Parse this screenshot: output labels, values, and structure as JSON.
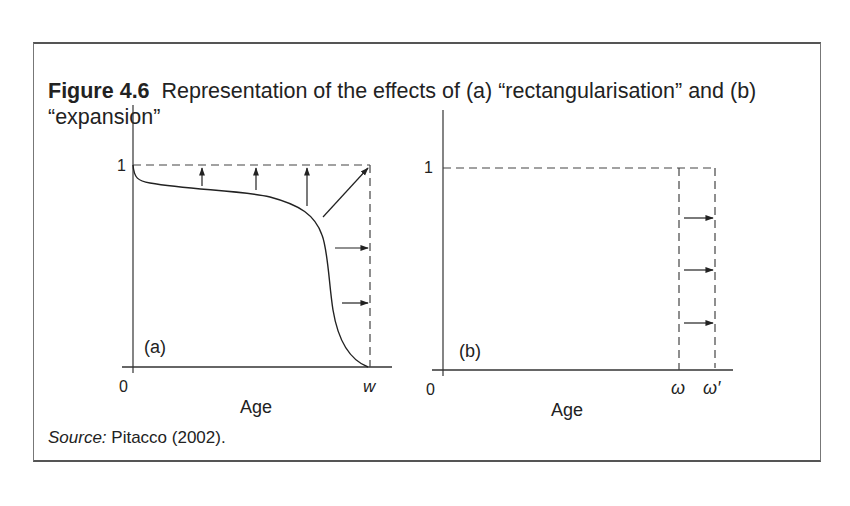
{
  "figure": {
    "label": "Figure 4.6",
    "caption": "Representation of the effects of (a) “rectangularisation” and (b) “expansion”",
    "source_label": "Source:",
    "source_text": "Pitacco (2002)."
  },
  "panels": [
    {
      "id": "a",
      "tag": "(a)",
      "y_tick": "1",
      "x_origin": "0",
      "x_end": "w",
      "x_label": "Age",
      "description": "Survival curve shifting towards the rectangle (rectangularisation), arrows point up and to the right"
    },
    {
      "id": "b",
      "tag": "(b)",
      "y_tick": "1",
      "x_origin": "0",
      "x_end_1": "ω",
      "x_end_2": "ω′",
      "x_label": "Age",
      "description": "Rectangle expanding from ω to ω′ (expansion), horizontal arrows point right"
    }
  ],
  "colors": {
    "ink": "#222222",
    "frame": "#666666",
    "background": "#ffffff"
  }
}
